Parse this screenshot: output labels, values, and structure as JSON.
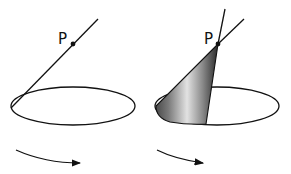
{
  "figure": {
    "left_panel": {
      "point_label": "P",
      "line": {
        "x1": 11,
        "y1": 108,
        "x2": 98,
        "y2": 19
      },
      "point": {
        "cx": 73,
        "cy": 44
      },
      "ellipse": {
        "cx": 73,
        "cy": 106,
        "rx": 62,
        "ry": 19
      },
      "rotation_arrow": "clockwise-arrow"
    },
    "right_panel": {
      "point_label": "P",
      "point": {
        "cx": 218,
        "cy": 44
      },
      "ellipse": {
        "cx": 217,
        "cy": 106,
        "rx": 62,
        "ry": 19
      },
      "cone_shading": "gray-gradient",
      "rotation_arrow": "clockwise-arrow"
    },
    "colors": {
      "stroke": "#111111",
      "background": "#ffffff",
      "cone_dark": "#3a3a3a",
      "cone_light": "#d8d8d8"
    }
  }
}
